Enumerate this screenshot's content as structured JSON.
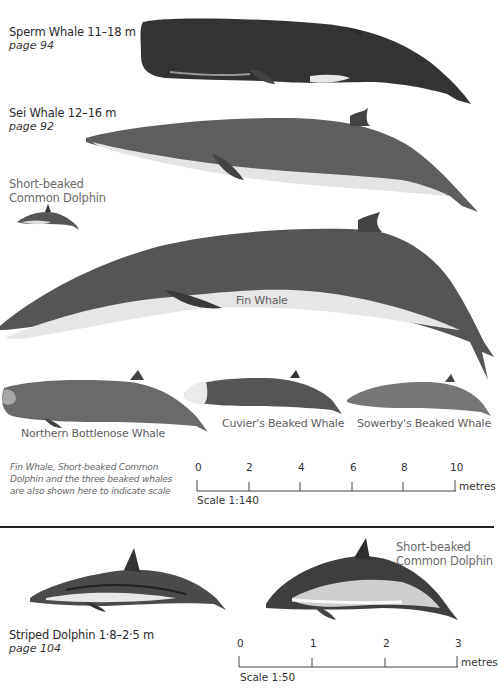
{
  "species": [
    {
      "name": "Sperm Whale 11–18 m",
      "page": "page 94"
    },
    {
      "name": "Sei Whale 12–16 m",
      "page": "page 92"
    },
    {
      "name": "Short-beaked Common Dolphin"
    },
    {
      "name": "Fin Whale"
    },
    {
      "name": "Northern Bottlenose Whale"
    },
    {
      "name": "Cuvier's Beaked Whale"
    },
    {
      "name": "Sowerby's Beaked Whale"
    },
    {
      "name": "Striped Dolphin 1·8–2·5 m",
      "page": "page 104"
    },
    {
      "name": "Short-beaked Common Dolphin"
    }
  ],
  "labels": {
    "sperm": "Sperm Whale 11–18 m",
    "sperm_page": "page 94",
    "sei": "Sei Whale 12–16 m",
    "sei_page": "page 92",
    "common_small_line1": "Short-beaked",
    "common_small_line2": "Common Dolphin",
    "fin": "Fin Whale",
    "bottlenose": "Northern Bottlenose Whale",
    "cuviers": "Cuvier's Beaked Whale",
    "sowerbys": "Sowerby's Beaked Whale",
    "striped": "Striped Dolphin 1·8–2·5 m",
    "striped_page": "page 104",
    "common_large_line1": "Short-beaked",
    "common_large_line2": "Common Dolphin"
  },
  "note": {
    "line1": "Fin Whale, Short-beaked Common",
    "line2": "Dolphin and the three beaked whales",
    "line3": "are also shown here to indicate scale"
  },
  "scale_top": {
    "ticks": [
      "0",
      "2",
      "4",
      "6",
      "8",
      "10"
    ],
    "unit": "metres",
    "label": "Scale 1:140"
  },
  "scale_bottom": {
    "ticks": [
      "0",
      "1",
      "2",
      "3"
    ],
    "unit": "metres",
    "label": "Scale 1:50"
  },
  "colors": {
    "background": "#ffffff",
    "whale_dark": "#3a3a3a",
    "whale_mid": "#6b6b6b",
    "whale_belly": "#e6e6e6",
    "divider": "#222222"
  }
}
